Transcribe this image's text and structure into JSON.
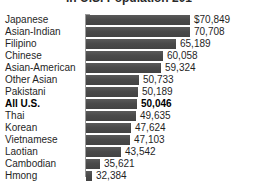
{
  "chart_data": {
    "type": "bar",
    "orientation": "horizontal",
    "title": "in U.S. Population 201",
    "xlabel": "",
    "ylabel": "",
    "grid": false,
    "legend": "none",
    "baseline": 30000,
    "xmax": 73000,
    "categories": [
      "Japanese",
      "Asian-Indian",
      "Filipino",
      "Chinese",
      "Asian-American",
      "Other Asian",
      "Pakistani",
      "All U.S.",
      "Thai",
      "Korean",
      "Vietnamese",
      "Laotian",
      "Cambodian",
      "Hmong"
    ],
    "values": [
      70849,
      70708,
      65189,
      60058,
      59324,
      50733,
      50189,
      50046,
      49635,
      47624,
      47103,
      43542,
      35621,
      32384
    ],
    "value_labels": [
      "$70,849",
      "70,708",
      "65,189",
      "60,058",
      "59,324",
      "50,733",
      "50,189",
      "50,046",
      "49,635",
      "47,624",
      "47,103",
      "43,542",
      "35,621",
      "32,384"
    ],
    "highlight_index": 7,
    "bar_color": "#4d4d4d",
    "text_color": "#1f1f1f",
    "axis_color": "#9a9a9a",
    "background": "#ffffff"
  }
}
